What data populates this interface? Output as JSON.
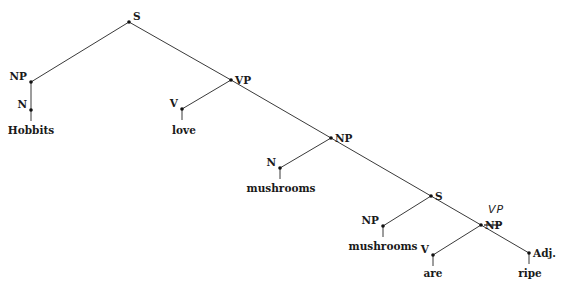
{
  "diagram": {
    "type": "parse-tree",
    "sentence": "Hobbits love mushrooms mushrooms are ripe",
    "nodes": [
      {
        "id": "S1",
        "label": "S",
        "x": 129,
        "y": 22,
        "lx": 133,
        "ly": 20,
        "anchor": "start"
      },
      {
        "id": "NP1",
        "label": "NP",
        "x": 31,
        "y": 82,
        "lx": 27,
        "ly": 80,
        "anchor": "end"
      },
      {
        "id": "N1",
        "label": "N",
        "x": 31,
        "y": 110,
        "lx": 27,
        "ly": 108,
        "anchor": "end"
      },
      {
        "id": "VP1",
        "label": "VP",
        "x": 231,
        "y": 80,
        "lx": 235,
        "ly": 84,
        "anchor": "start"
      },
      {
        "id": "V1",
        "label": "V",
        "x": 182,
        "y": 109,
        "lx": 178,
        "ly": 107,
        "anchor": "end"
      },
      {
        "id": "NP2",
        "label": "NP",
        "x": 331,
        "y": 138,
        "lx": 335,
        "ly": 142,
        "anchor": "start"
      },
      {
        "id": "N2",
        "label": "N",
        "x": 280,
        "y": 168,
        "lx": 276,
        "ly": 166,
        "anchor": "end"
      },
      {
        "id": "S2",
        "label": "S",
        "x": 431,
        "y": 196,
        "lx": 435,
        "ly": 200,
        "anchor": "start"
      },
      {
        "id": "NP3",
        "label": "NP",
        "x": 383,
        "y": 226,
        "lx": 379,
        "ly": 224,
        "anchor": "end"
      },
      {
        "id": "VP2",
        "label": "NP",
        "x": 481,
        "y": 225,
        "lx": 485,
        "ly": 229,
        "anchor": "start",
        "struck": true,
        "correction": "VP"
      },
      {
        "id": "V2",
        "label": "V",
        "x": 433,
        "y": 255,
        "lx": 429,
        "ly": 253,
        "anchor": "end"
      },
      {
        "id": "ADJ1",
        "label": "Adj.",
        "x": 529,
        "y": 253,
        "lx": 533,
        "ly": 257,
        "anchor": "start"
      }
    ],
    "edges": [
      [
        "S1",
        "NP1"
      ],
      [
        "S1",
        "VP1"
      ],
      [
        "NP1",
        "N1"
      ],
      [
        "VP1",
        "V1"
      ],
      [
        "VP1",
        "NP2"
      ],
      [
        "NP2",
        "N2"
      ],
      [
        "NP2",
        "S2"
      ],
      [
        "S2",
        "NP3"
      ],
      [
        "S2",
        "VP2"
      ],
      [
        "VP2",
        "V2"
      ],
      [
        "VP2",
        "ADJ1"
      ]
    ],
    "leaves": [
      {
        "parent": "N1",
        "word": "Hobbits",
        "x": 31,
        "y": 134
      },
      {
        "parent": "V1",
        "word": "love",
        "x": 184,
        "y": 134
      },
      {
        "parent": "N2",
        "word": "mushrooms",
        "x": 281,
        "y": 192
      },
      {
        "parent": "NP3",
        "word": "mushrooms",
        "x": 383,
        "y": 250
      },
      {
        "parent": "V2",
        "word": "are",
        "x": 433,
        "y": 277
      },
      {
        "parent": "ADJ1",
        "word": "ripe",
        "x": 530,
        "y": 277
      }
    ],
    "annotation": {
      "text": "VP",
      "note": "handwritten correction replacing struck-through NP",
      "x": 488,
      "y": 213
    }
  }
}
